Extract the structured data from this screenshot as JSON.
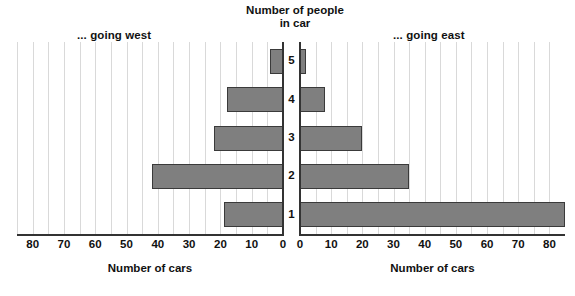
{
  "chart_data": {
    "type": "bar",
    "title": "Number of people in car",
    "subtype": "population-pyramid",
    "orientation": "horizontal-diverging",
    "categories": [
      "1",
      "2",
      "3",
      "4",
      "5"
    ],
    "category_axis_label": "Number of people in car",
    "series": [
      {
        "name": "... going west",
        "side": "left",
        "values": [
          19,
          42,
          22,
          18,
          4
        ],
        "xlabel": "Number of cars",
        "ticks": [
          80,
          70,
          60,
          50,
          40,
          30,
          20,
          10,
          0
        ],
        "xlim": [
          80,
          0
        ]
      },
      {
        "name": "... going east",
        "side": "right",
        "values": [
          85,
          35,
          20,
          8,
          2
        ],
        "xlabel": "Number of cars",
        "ticks": [
          0,
          10,
          20,
          30,
          40,
          50,
          60,
          70,
          80
        ],
        "xlim": [
          0,
          85
        ]
      }
    ],
    "grid": true,
    "legend": "none",
    "bar_color": "#7f7f7f",
    "bar_border_color": "#3a3a3a",
    "axis_color": "#333333",
    "gridline_color": "#d9d9d9"
  },
  "headings": {
    "west": "... going west",
    "east": "... going east"
  },
  "center_title": {
    "line1": "Number of people",
    "line2": "in car"
  },
  "axis_titles": {
    "west": "Number of cars",
    "east": "Number of cars"
  },
  "ticks_west": [
    "80",
    "70",
    "60",
    "50",
    "40",
    "30",
    "20",
    "10",
    "0"
  ],
  "ticks_east": [
    "0",
    "10",
    "20",
    "30",
    "40",
    "50",
    "60",
    "70",
    "80"
  ],
  "row_labels": [
    "5",
    "4",
    "3",
    "2",
    "1"
  ]
}
